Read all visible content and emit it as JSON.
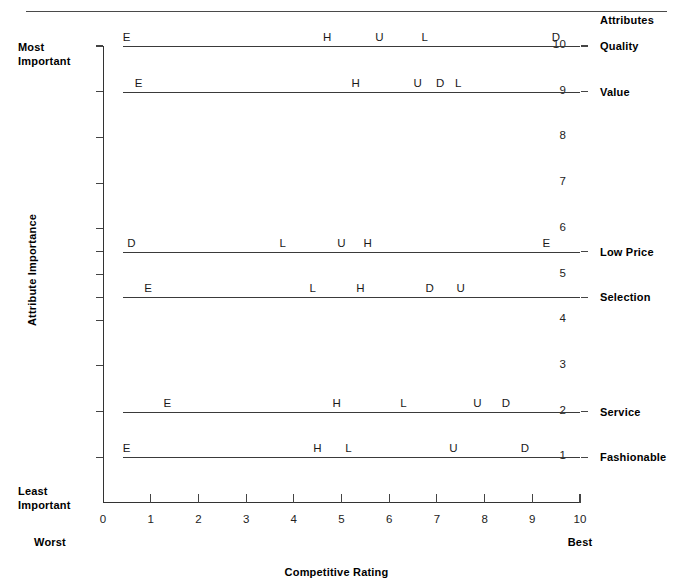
{
  "chart_data": {
    "type": "scatter",
    "title": "",
    "xlabel": "Competitive Rating",
    "ylabel": "Attribute Importance",
    "xlim": [
      0,
      10
    ],
    "ylim": [
      0,
      10
    ],
    "grid": false,
    "legend_position": "right",
    "x_ticks": [
      "0",
      "1",
      "2",
      "3",
      "4",
      "5",
      "6",
      "7",
      "8",
      "9",
      "10"
    ],
    "y_ticks": [
      "1",
      "2",
      "3",
      "4",
      "5",
      "6",
      "7",
      "8",
      "9",
      "10"
    ],
    "x_end_labels": {
      "low": "Worst",
      "high": "Best"
    },
    "y_end_labels": {
      "high": "Most Important",
      "low": "Least Important"
    },
    "attributes_header": "Attributes",
    "competitor_codes": [
      "E",
      "H",
      "U",
      "L",
      "D"
    ],
    "series": [
      {
        "name": "Quality",
        "importance": 10,
        "points": [
          {
            "code": "E",
            "rating": 0.5
          },
          {
            "code": "H",
            "rating": 4.7
          },
          {
            "code": "U",
            "rating": 5.8
          },
          {
            "code": "L",
            "rating": 6.75
          },
          {
            "code": "D",
            "rating": 9.5
          }
        ]
      },
      {
        "name": "Value",
        "importance": 9,
        "points": [
          {
            "code": "E",
            "rating": 0.75
          },
          {
            "code": "H",
            "rating": 5.3
          },
          {
            "code": "U",
            "rating": 6.6
          },
          {
            "code": "D",
            "rating": 7.07
          },
          {
            "code": "L",
            "rating": 7.45
          }
        ]
      },
      {
        "name": "Low Price",
        "importance": 5.5,
        "points": [
          {
            "code": "D",
            "rating": 0.6
          },
          {
            "code": "L",
            "rating": 3.77
          },
          {
            "code": "U",
            "rating": 5.0
          },
          {
            "code": "H",
            "rating": 5.55
          },
          {
            "code": "E",
            "rating": 9.3
          }
        ]
      },
      {
        "name": "Selection",
        "importance": 4.5,
        "points": [
          {
            "code": "E",
            "rating": 0.95
          },
          {
            "code": "L",
            "rating": 4.4
          },
          {
            "code": "H",
            "rating": 5.4
          },
          {
            "code": "D",
            "rating": 6.85
          },
          {
            "code": "U",
            "rating": 7.5
          }
        ]
      },
      {
        "name": "Service",
        "importance": 2,
        "points": [
          {
            "code": "E",
            "rating": 1.35
          },
          {
            "code": "H",
            "rating": 4.9
          },
          {
            "code": "L",
            "rating": 6.3
          },
          {
            "code": "U",
            "rating": 7.85
          },
          {
            "code": "D",
            "rating": 8.45
          }
        ]
      },
      {
        "name": "Fashionable",
        "importance": 1,
        "points": [
          {
            "code": "E",
            "rating": 0.5
          },
          {
            "code": "H",
            "rating": 4.5
          },
          {
            "code": "L",
            "rating": 5.15
          },
          {
            "code": "U",
            "rating": 7.35
          },
          {
            "code": "D",
            "rating": 8.85
          }
        ]
      }
    ]
  },
  "colors": {
    "line": "#3a3a3a",
    "axis": "#333333",
    "text": "#111111",
    "rule": "#4a4a4a"
  }
}
